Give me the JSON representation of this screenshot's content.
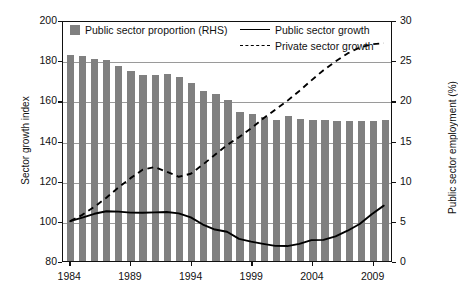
{
  "chart_data": {
    "type": "bar",
    "title": "",
    "xlabel": "",
    "ylabel": "Sector growth index",
    "ylabel_right": "Public sector employment (%)",
    "xlim": [
      1983.4,
      2010.6
    ],
    "ylim": [
      80,
      200
    ],
    "ylim_right": [
      0,
      30
    ],
    "yticks": [
      80,
      100,
      120,
      140,
      160,
      180,
      200
    ],
    "yticks_right": [
      0,
      5,
      10,
      15,
      20,
      25,
      30
    ],
    "xticks": [
      1984,
      1989,
      1994,
      1999,
      2004,
      2009
    ],
    "grid": true,
    "legend_position": "top",
    "categories": [
      1984,
      1985,
      1986,
      1987,
      1988,
      1989,
      1990,
      1991,
      1992,
      1993,
      1994,
      1995,
      1996,
      1997,
      1998,
      1999,
      2000,
      2001,
      2002,
      2003,
      2004,
      2005,
      2006,
      2007,
      2008,
      2009,
      2010
    ],
    "series": [
      {
        "name": "Public sector proportion (RHS)",
        "type": "bar",
        "axis": "right",
        "color": "#808080",
        "unit": "%",
        "values": [
          25.6,
          25.5,
          25.2,
          25.0,
          24.3,
          23.6,
          23.1,
          23.2,
          23.3,
          22.9,
          22.1,
          21.2,
          20.8,
          20.0,
          18.6,
          18.3,
          17.9,
          17.6,
          18.0,
          17.7,
          17.5,
          17.5,
          17.4,
          17.4,
          17.4,
          17.4,
          17.6
        ]
      },
      {
        "name": "Public sector growth",
        "type": "line",
        "axis": "left",
        "style": "solid",
        "color": "#000000",
        "values": [
          100.0,
          101.8,
          103.7,
          105.0,
          104.8,
          104.3,
          104.2,
          104.4,
          104.6,
          103.9,
          101.9,
          98.3,
          95.8,
          94.7,
          91.1,
          89.7,
          88.6,
          87.6,
          87.5,
          88.6,
          90.5,
          90.6,
          92.4,
          95.2,
          98.6,
          103.5,
          107.8
        ]
      },
      {
        "name": "Private sector growth",
        "type": "line",
        "axis": "left",
        "style": "dashed",
        "color": "#000000",
        "values": [
          100.0,
          103.2,
          107.2,
          111.8,
          116.9,
          121.6,
          125.8,
          127.2,
          124.8,
          122.3,
          123.8,
          128.4,
          133.3,
          138.2,
          142.2,
          146.6,
          151.5,
          156.0,
          160.4,
          165.4,
          170.7,
          175.8,
          180.2,
          184.2,
          187.2,
          188.8,
          189.4
        ]
      }
    ]
  },
  "legend": {
    "items": [
      {
        "label": "Public sector proportion (RHS)",
        "marker": "square-swatch"
      },
      {
        "label": "Public sector growth",
        "marker": "solid-line"
      },
      {
        "label": "Private sector growth",
        "marker": "dashed-line"
      }
    ]
  }
}
